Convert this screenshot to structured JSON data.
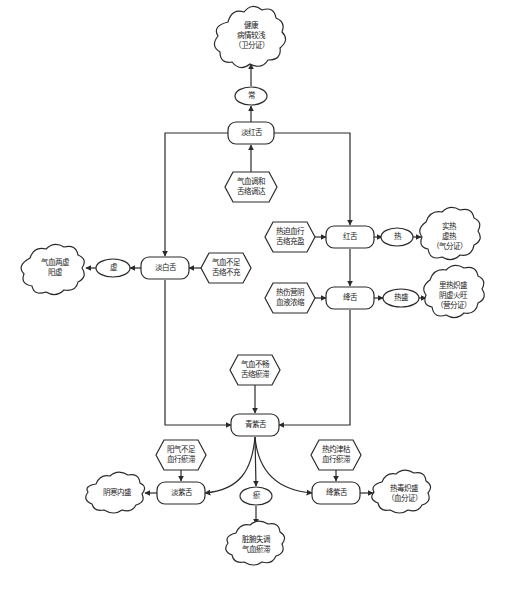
{
  "diagram": {
    "type": "flowchart",
    "nodes": {
      "healthy": {
        "label": "健康\n病情较浅\n（卫分证）",
        "shape": "cloud"
      },
      "normal": {
        "label": "常",
        "shape": "ellipse"
      },
      "pale_red": {
        "label": "淡红舌",
        "shape": "rounded-rect"
      },
      "qi_blood_harmony": {
        "label": "气血调和\n舌络调达",
        "shape": "hexagon"
      },
      "pale_white": {
        "label": "淡白舌",
        "shape": "rounded-rect"
      },
      "qi_blood_deficient": {
        "label": "气血不足\n舌络不充",
        "shape": "hexagon"
      },
      "deficiency": {
        "label": "虚",
        "shape": "ellipse"
      },
      "dual_deficiency": {
        "label": "气血两虚\n阳虚",
        "shape": "cloud"
      },
      "red": {
        "label": "红舌",
        "shape": "rounded-rect"
      },
      "heat_forces_blood": {
        "label": "热迫血行\n舌络充盈",
        "shape": "hexagon"
      },
      "heat": {
        "label": "热",
        "shape": "ellipse"
      },
      "excess_heat": {
        "label": "实热\n虚热\n（气分证）",
        "shape": "cloud"
      },
      "crimson": {
        "label": "绛舌",
        "shape": "rounded-rect"
      },
      "heat_injures_yin": {
        "label": "热伤营阴\n血液浓缩",
        "shape": "hexagon"
      },
      "heat_excess": {
        "label": "热盛",
        "shape": "ellipse"
      },
      "severe_heat": {
        "label": "里热炽盛\n阴虚火旺\n（营分证）",
        "shape": "cloud"
      },
      "qi_blood_stagnant": {
        "label": "气血不畅\n舌络瘀滞",
        "shape": "hexagon"
      },
      "blue_purple": {
        "label": "青紫舌",
        "shape": "rounded-rect"
      },
      "yang_deficient": {
        "label": "阳气不足\n血行瘀滞",
        "shape": "hexagon"
      },
      "pale_purple": {
        "label": "淡紫舌",
        "shape": "rounded-rect"
      },
      "yin_cold": {
        "label": "阴寒内盛",
        "shape": "cloud"
      },
      "stasis": {
        "label": "瘀",
        "shape": "ellipse"
      },
      "organ_disorder": {
        "label": "脏腑失调\n气血瘀滞",
        "shape": "cloud"
      },
      "heat_depletes_fluid": {
        "label": "热灼津枯\n血行瘀滞",
        "shape": "hexagon"
      },
      "crimson_purple": {
        "label": "绛紫舌",
        "shape": "rounded-rect"
      },
      "heat_toxin": {
        "label": "热毒炽盛\n（血分证）",
        "shape": "cloud"
      }
    },
    "edges": [
      [
        "pale_red",
        "normal"
      ],
      [
        "normal",
        "healthy"
      ],
      [
        "qi_blood_harmony",
        "pale_red"
      ],
      [
        "pale_red",
        "pale_white"
      ],
      [
        "pale_red",
        "red"
      ],
      [
        "qi_blood_deficient",
        "pale_white"
      ],
      [
        "pale_white",
        "deficiency"
      ],
      [
        "deficiency",
        "dual_deficiency"
      ],
      [
        "heat_forces_blood",
        "red"
      ],
      [
        "red",
        "heat"
      ],
      [
        "heat",
        "excess_heat"
      ],
      [
        "red",
        "crimson"
      ],
      [
        "heat_injures_yin",
        "crimson"
      ],
      [
        "crimson",
        "heat_excess"
      ],
      [
        "heat_excess",
        "severe_heat"
      ],
      [
        "pale_white",
        "blue_purple"
      ],
      [
        "crimson",
        "blue_purple"
      ],
      [
        "qi_blood_stagnant",
        "blue_purple"
      ],
      [
        "blue_purple",
        "pale_purple"
      ],
      [
        "blue_purple",
        "stasis"
      ],
      [
        "blue_purple",
        "crimson_purple"
      ],
      [
        "yang_deficient",
        "pale_purple"
      ],
      [
        "pale_purple",
        "yin_cold"
      ],
      [
        "stasis",
        "organ_disorder"
      ],
      [
        "heat_depletes_fluid",
        "crimson_purple"
      ],
      [
        "crimson_purple",
        "heat_toxin"
      ]
    ]
  }
}
